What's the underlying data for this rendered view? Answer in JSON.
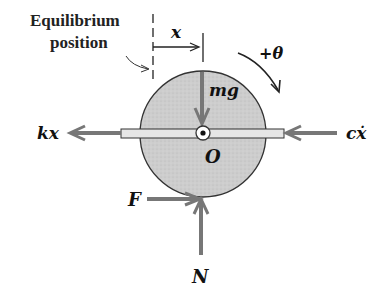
{
  "diagram": {
    "labels": {
      "equilibrium_line1": "Equilibrium",
      "equilibrium_line2": "position",
      "displacement": "x",
      "rotation": "+θ",
      "weight": "mg",
      "center": "O",
      "spring_force": "kx",
      "damper_force": "cẋ",
      "friction": "F",
      "normal": "N"
    },
    "colors": {
      "disk_fill": "#cfcfcf",
      "disk_stroke": "#333333",
      "arrow": "#777777",
      "bar_fill": "#e6e6e6",
      "text": "#111111"
    }
  }
}
